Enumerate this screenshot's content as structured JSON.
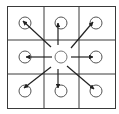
{
  "diagram": {
    "type": "grid-neighborhood",
    "grid": {
      "rows": 3,
      "cols": 3
    },
    "center": {
      "row": 1,
      "col": 1
    },
    "neighbors": [
      {
        "name": "top-left",
        "row": 0,
        "col": 0
      },
      {
        "name": "top",
        "row": 0,
        "col": 1
      },
      {
        "name": "top-right",
        "row": 0,
        "col": 2
      },
      {
        "name": "left",
        "row": 1,
        "col": 0
      },
      {
        "name": "right",
        "row": 1,
        "col": 2
      },
      {
        "name": "bottom-left",
        "row": 2,
        "col": 0
      },
      {
        "name": "bottom",
        "row": 2,
        "col": 1
      },
      {
        "name": "bottom-right",
        "row": 2,
        "col": 2
      }
    ],
    "colors": {
      "line": "#3a3a3a",
      "arrow": "#222222",
      "circle": "#555555",
      "background": "#ffffff"
    }
  }
}
